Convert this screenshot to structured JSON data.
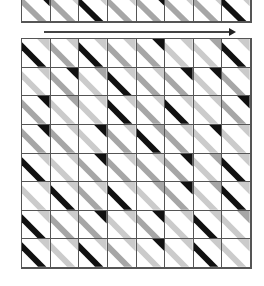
{
  "colors": {
    "K": "#111111",
    "D": "#a6a6a6",
    "L": "#cbcbcb",
    "W": "#ffffff",
    "grid_line": "#555555"
  },
  "legend": {
    "K": "black",
    "D": "dark-gray",
    "L": "light-gray"
  },
  "top_strip": [
    [
      "K",
      "D"
    ],
    [
      "L",
      "D"
    ],
    [
      "L",
      "K"
    ],
    [
      "L",
      "D"
    ],
    [
      "K",
      "D"
    ],
    [
      "L",
      "D"
    ],
    [
      "L",
      "D"
    ],
    [
      "L",
      "K"
    ]
  ],
  "arrow": {
    "direction": "right"
  },
  "grid": {
    "rows": 8,
    "cols": 8,
    "cells": [
      [
        [
          "L",
          "K"
        ],
        [
          "L",
          "D"
        ],
        [
          "L",
          "K"
        ],
        [
          "L",
          "D"
        ],
        [
          "K",
          "D"
        ],
        [
          "L",
          "L"
        ],
        [
          "D",
          "L"
        ],
        [
          "L",
          "K"
        ]
      ],
      [
        [
          "L",
          "L"
        ],
        [
          "K",
          "D"
        ],
        [
          "D",
          "L"
        ],
        [
          "L",
          "K"
        ],
        [
          "L",
          "D"
        ],
        [
          "K",
          "D"
        ],
        [
          "K",
          "L"
        ],
        [
          "L",
          "D"
        ]
      ],
      [
        [
          "K",
          "D"
        ],
        [
          "D",
          "L"
        ],
        [
          "L",
          "L"
        ],
        [
          "L",
          "K"
        ],
        [
          "L",
          "D"
        ],
        [
          "L",
          "K"
        ],
        [
          "L",
          "L"
        ],
        [
          "K",
          "D"
        ]
      ],
      [
        [
          "K",
          "D"
        ],
        [
          "L",
          "D"
        ],
        [
          "K",
          "L"
        ],
        [
          "L",
          "D"
        ],
        [
          "D",
          "K"
        ],
        [
          "L",
          "D"
        ],
        [
          "K",
          "L"
        ],
        [
          "L",
          "L"
        ]
      ],
      [
        [
          "L",
          "K"
        ],
        [
          "L",
          "L"
        ],
        [
          "K",
          "D"
        ],
        [
          "L",
          "D"
        ],
        [
          "L",
          "D"
        ],
        [
          "K",
          "D"
        ],
        [
          "D",
          "L"
        ],
        [
          "L",
          "K"
        ]
      ],
      [
        [
          "L",
          "L"
        ],
        [
          "L",
          "K"
        ],
        [
          "L",
          "D"
        ],
        [
          "L",
          "K"
        ],
        [
          "D",
          "L"
        ],
        [
          "K",
          "D"
        ],
        [
          "D",
          "L"
        ],
        [
          "L",
          "K"
        ]
      ],
      [
        [
          "L",
          "K"
        ],
        [
          "L",
          "D"
        ],
        [
          "K",
          "D"
        ],
        [
          "L",
          "L"
        ],
        [
          "K",
          "D"
        ],
        [
          "L",
          "L"
        ],
        [
          "L",
          "K"
        ],
        [
          "D",
          "L"
        ]
      ],
      [
        [
          "L",
          "K"
        ],
        [
          "L",
          "L"
        ],
        [
          "L",
          "K"
        ],
        [
          "L",
          "D"
        ],
        [
          "K",
          "L"
        ],
        [
          "L",
          "L"
        ],
        [
          "L",
          "K"
        ],
        [
          "L",
          "L"
        ]
      ]
    ]
  }
}
